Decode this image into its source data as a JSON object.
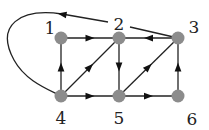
{
  "graph": {
    "type": "directed",
    "node_color": "#8c8c8c",
    "edge_color": "#222222",
    "nodes": [
      {
        "id": "1",
        "label": "1",
        "x": 61,
        "y": 38,
        "lx": 50,
        "ly": 34
      },
      {
        "id": "2",
        "label": "2",
        "x": 119,
        "y": 38,
        "lx": 119,
        "ly": 30
      },
      {
        "id": "3",
        "label": "3",
        "x": 178,
        "y": 38,
        "lx": 194,
        "ly": 33
      },
      {
        "id": "4",
        "label": "4",
        "x": 61,
        "y": 96,
        "lx": 61,
        "ly": 124
      },
      {
        "id": "5",
        "label": "5",
        "x": 119,
        "y": 96,
        "lx": 119,
        "ly": 124
      },
      {
        "id": "6",
        "label": "6",
        "x": 178,
        "y": 96,
        "lx": 192,
        "ly": 125
      }
    ],
    "edges": [
      {
        "from": "1",
        "to": "2"
      },
      {
        "from": "3",
        "to": "2"
      },
      {
        "from": "2",
        "to": "5"
      },
      {
        "from": "4",
        "to": "1"
      },
      {
        "from": "4",
        "to": "2"
      },
      {
        "from": "4",
        "to": "5"
      },
      {
        "from": "5",
        "to": "3"
      },
      {
        "from": "5",
        "to": "6"
      },
      {
        "from": "6",
        "to": "3"
      },
      {
        "from": "3",
        "to": "4",
        "curved": true
      }
    ]
  }
}
